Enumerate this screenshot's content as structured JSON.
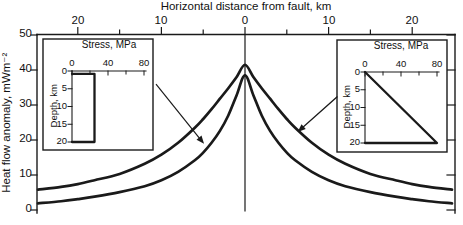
{
  "figure": {
    "kind": "scientific line chart with two stress-profile insets",
    "background": "#ffffff",
    "line_color": "#1a1a1a"
  },
  "chart_data": {
    "type": "line",
    "title": "",
    "xlabel": "Horizontal distance from fault, km",
    "ylabel": "Heat flow anomaly, mWm⁻²",
    "xlim": [
      -25,
      25
    ],
    "ylim": [
      0,
      50
    ],
    "grid": false,
    "x_major_ticks": [
      -20,
      -10,
      0,
      10,
      20
    ],
    "x_major_tick_labels": [
      "20",
      "10",
      "0",
      "10",
      "20"
    ],
    "x_minor_ticks": [
      -15,
      -5,
      5,
      15
    ],
    "y_ticks": [
      50,
      40,
      30,
      20,
      10,
      0
    ],
    "y_tick_labels": [
      "50",
      "40",
      "30",
      "20",
      "10",
      "0"
    ],
    "fault_line_x": 0,
    "series": [
      {
        "name": "heat-flow-linear-stress-model",
        "linked_inset": "right",
        "x": [
          -25,
          -22,
          -20,
          -18,
          -15,
          -12,
          -10,
          -8,
          -6,
          -5,
          -4,
          -3,
          -2,
          -1,
          0,
          1,
          2,
          3,
          4,
          5,
          6,
          8,
          10,
          12,
          15,
          18,
          20,
          22,
          25
        ],
        "y": [
          5.8,
          6.6,
          7.4,
          8.5,
          10.3,
          13.2,
          15.8,
          19.2,
          23.5,
          26,
          28.8,
          31.8,
          34.8,
          38,
          41.5,
          38,
          34.8,
          31.8,
          28.8,
          26,
          23.5,
          19.2,
          15.8,
          13.2,
          10.3,
          8.5,
          7.4,
          6.6,
          5.8
        ]
      },
      {
        "name": "heat-flow-constant-stress-model",
        "linked_inset": "left",
        "x": [
          -25,
          -22,
          -20,
          -18,
          -15,
          -12,
          -10,
          -8,
          -6,
          -5,
          -4,
          -3,
          -2,
          -1,
          0,
          1,
          2,
          3,
          4,
          5,
          6,
          8,
          10,
          12,
          15,
          18,
          20,
          22,
          25
        ],
        "y": [
          1.9,
          2.5,
          3.1,
          3.8,
          5.1,
          6.8,
          8.5,
          10.9,
          14.2,
          16.4,
          19.2,
          22.6,
          27,
          32.8,
          38.5,
          32.8,
          27,
          22.6,
          19.2,
          16.4,
          14.2,
          10.9,
          8.5,
          6.8,
          5.1,
          3.8,
          3.1,
          2.5,
          1.9
        ]
      }
    ],
    "arrows": [
      {
        "from_inset": "left",
        "x1": -10.6,
        "y1": 35.8,
        "x2": -4.9,
        "y2": 18.9
      },
      {
        "from_inset": "right",
        "x1": 11.0,
        "y1": 32.3,
        "x2": 6.3,
        "y2": 22.3
      }
    ],
    "insets": {
      "left": {
        "title": "Stress, MPa",
        "ylabel": "Depth, km",
        "xlim": [
          0,
          80
        ],
        "ylim": [
          0,
          20
        ],
        "x_ticks": [
          0,
          40,
          80
        ],
        "x_tick_labels": [
          "0",
          "40",
          "80"
        ],
        "x_minor_ticks": [
          20,
          60
        ],
        "y_ticks": [
          0,
          5,
          10,
          15,
          20
        ],
        "y_tick_labels": [
          "0",
          "5",
          "10",
          "15",
          "20"
        ],
        "profile_type": "constant",
        "profile_stress_depth": [
          [
            0,
            0.8
          ],
          [
            25,
            0.8
          ],
          [
            25,
            20
          ],
          [
            0,
            20
          ]
        ]
      },
      "right": {
        "title": "Stress, MPa",
        "ylabel": "Depth, km",
        "xlim": [
          0,
          80
        ],
        "ylim": [
          0,
          20
        ],
        "x_ticks": [
          0,
          40,
          80
        ],
        "x_tick_labels": [
          "0",
          "40",
          "80"
        ],
        "x_minor_ticks": [
          20,
          60
        ],
        "y_ticks": [
          0,
          5,
          10,
          15,
          20
        ],
        "y_tick_labels": [
          "0",
          "5",
          "10",
          "15",
          "20"
        ],
        "profile_type": "linear",
        "profile_stress_depth": [
          [
            0,
            0
          ],
          [
            80,
            20
          ],
          [
            0,
            20
          ]
        ]
      }
    }
  }
}
